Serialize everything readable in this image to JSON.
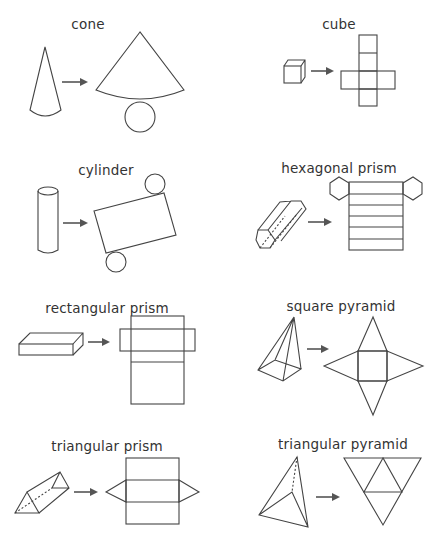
{
  "figures": [
    {
      "name": "cone",
      "label": "cone"
    },
    {
      "name": "cube",
      "label": "cube"
    },
    {
      "name": "cylinder",
      "label": "cylinder"
    },
    {
      "name": "hexagonal-prism",
      "label": "hexagonal prism"
    },
    {
      "name": "rectangular-prism",
      "label": "rectangular prism"
    },
    {
      "name": "square-pyramid",
      "label": "square pyramid"
    },
    {
      "name": "triangular-prism",
      "label": "triangular prism"
    },
    {
      "name": "triangular-pyramid",
      "label": "triangular pyramid"
    }
  ],
  "colors": {
    "line": "#444444",
    "text": "#333333",
    "background": "#ffffff"
  }
}
